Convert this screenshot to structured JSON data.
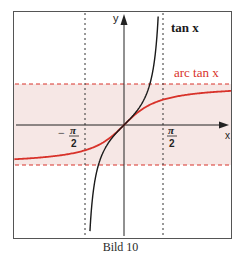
{
  "caption": "Bild 10",
  "labels": {
    "tan": "tan x",
    "arctan": "arc tan x",
    "x_axis": "x",
    "y_axis": "y",
    "neg_pi_half_num": "π",
    "neg_pi_half_den": "2",
    "neg_sign": "−",
    "pos_pi_half_num": "π",
    "pos_pi_half_den": "2"
  },
  "colors": {
    "frame": "#555555",
    "axis": "#222222",
    "tan_curve": "#1a1a1a",
    "arctan_curve": "#d8322a",
    "band_fill": "#f6e7e5",
    "asymptote_red": "#d8322a",
    "asymptote_black": "#333333",
    "arctan_label": "#d8322a"
  },
  "chart_data": {
    "type": "line",
    "title": "",
    "caption": "Bild 10",
    "xlabel": "x",
    "ylabel": "y",
    "series": [
      {
        "name": "tan x",
        "function": "tan(x)",
        "domain": [
          -1.571,
          1.571
        ],
        "color": "#1a1a1a"
      },
      {
        "name": "arc tan x",
        "function": "arctan(x)",
        "domain": [
          -4.3,
          4.2
        ],
        "color": "#d8322a"
      }
    ],
    "annotations": [
      {
        "type": "vertical_asymptote",
        "x": -1.5708,
        "label": "-π/2",
        "style": "dashed black"
      },
      {
        "type": "vertical_asymptote",
        "x": 1.5708,
        "label": "π/2",
        "style": "dashed black"
      },
      {
        "type": "horizontal_asymptote",
        "y": 1.5708,
        "style": "dashed red"
      },
      {
        "type": "horizontal_asymptote",
        "y": -1.5708,
        "style": "dashed red"
      },
      {
        "type": "shaded_band",
        "y_range": [
          -1.5708,
          1.5708
        ],
        "color": "#f6e7e5"
      }
    ],
    "xlim": [
      -4.3,
      4.2
    ],
    "ylim": [
      -4.3,
      4.4
    ],
    "grid": false,
    "legend": "inline labels"
  }
}
